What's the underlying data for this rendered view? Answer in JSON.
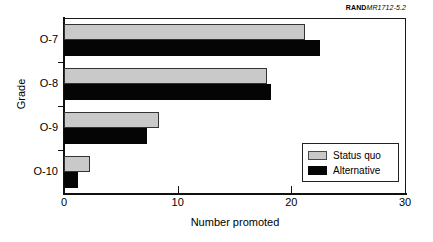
{
  "source_tag": {
    "brand": "RAND",
    "document": "MR1712-5.2"
  },
  "chart_data": {
    "type": "bar",
    "orientation": "horizontal",
    "title": "",
    "xlabel": "Number promoted",
    "ylabel": "Grade",
    "categories": [
      "O-7",
      "O-8",
      "O-9",
      "O-10"
    ],
    "series": [
      {
        "name": "Status quo",
        "color": "#c9c9c9",
        "values": [
          21.2,
          17.9,
          8.4,
          2.3
        ]
      },
      {
        "name": "Alternative",
        "color": "#050505",
        "values": [
          22.5,
          18.2,
          7.3,
          1.2
        ]
      }
    ],
    "xlim": [
      0,
      30
    ],
    "xticks": [
      "0",
      "10",
      "20",
      "30"
    ],
    "xtick_values": [
      0,
      10,
      20,
      30
    ],
    "grid": false,
    "legend_position": "lower-right"
  },
  "legend": {
    "entries": [
      {
        "label": "Status quo"
      },
      {
        "label": "Alternative"
      }
    ]
  }
}
